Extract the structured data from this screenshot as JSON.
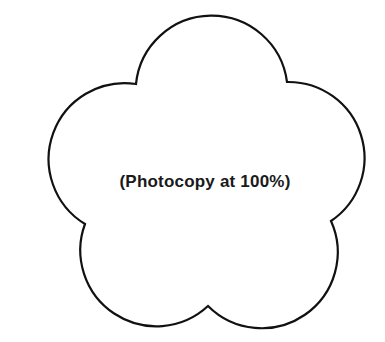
{
  "page": {
    "cutoff_text": "",
    "caption": "(Photocopy at 100%)"
  },
  "shape": {
    "type": "five-petal-flower-outline",
    "stroke_color": "#111111",
    "fill_color": "#ffffff",
    "stroke_width": 2.2,
    "cusps": [
      [
        136,
        84
      ],
      [
        287,
        82
      ],
      [
        331,
        221
      ],
      [
        208,
        306
      ],
      [
        85,
        224
      ]
    ]
  }
}
